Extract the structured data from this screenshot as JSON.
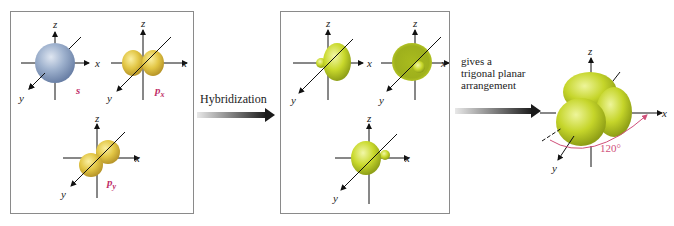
{
  "panels": {
    "left": {
      "orbitals": [
        {
          "name": "s",
          "label": "s",
          "color": "#8fa4c4"
        },
        {
          "name": "px",
          "label": "p",
          "subscript": "x",
          "color": "#e0c23c"
        },
        {
          "name": "py",
          "label": "p",
          "subscript": "y",
          "color": "#e0c23c"
        }
      ]
    },
    "middle": {
      "orbitals": [
        {
          "name": "sp2-1",
          "color": "#c7d72a"
        },
        {
          "name": "sp2-2",
          "color": "#c7d72a"
        },
        {
          "name": "sp2-3",
          "color": "#c7d72a"
        }
      ]
    },
    "right": {
      "angle_label": "120°",
      "color": "#c7d72a"
    }
  },
  "axes": {
    "x": "x",
    "y": "y",
    "z": "z"
  },
  "arrow1": {
    "label": "Hybridization"
  },
  "arrow2": {
    "label_lines": [
      "gives a",
      "trigonal planar",
      "arrangement"
    ]
  },
  "colors": {
    "label_pink": "#c0306a",
    "angle_pink": "#d0507a",
    "lobe_green": "#c7d72a",
    "lobe_yellow": "#e0c23c",
    "s_blue": "#8fa4c4"
  }
}
